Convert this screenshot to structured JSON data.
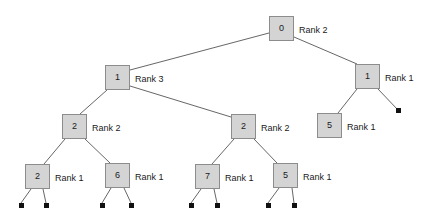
{
  "diagram": {
    "background_color": "#ffffff",
    "node_fill_color": "#d4d4d4",
    "node_border_color": "#8c8c8c",
    "edge_color": "#555555",
    "leaf_color": "#111111",
    "text_color": "#1a1a1a"
  },
  "nodes": [
    {
      "id": "n0",
      "key": "0",
      "rank": "Rank 2",
      "x": 269,
      "y": 16,
      "w": 25,
      "h": 25,
      "label_x": 299,
      "label_y": 26
    },
    {
      "id": "n1",
      "key": "1",
      "rank": "Rank 3",
      "x": 105,
      "y": 65,
      "w": 25,
      "h": 25,
      "label_x": 135,
      "label_y": 75
    },
    {
      "id": "n2",
      "key": "1",
      "rank": "Rank 1",
      "x": 355,
      "y": 64,
      "w": 25,
      "h": 25,
      "label_x": 385,
      "label_y": 74
    },
    {
      "id": "n3",
      "key": "2",
      "rank": "Rank 2",
      "x": 62,
      "y": 114,
      "w": 25,
      "h": 25,
      "label_x": 92,
      "label_y": 124
    },
    {
      "id": "n4",
      "key": "2",
      "rank": "Rank 2",
      "x": 231,
      "y": 114,
      "w": 25,
      "h": 25,
      "label_x": 261,
      "label_y": 124
    },
    {
      "id": "n5",
      "key": "5",
      "rank": "Rank 1",
      "x": 317,
      "y": 113,
      "w": 25,
      "h": 25,
      "label_x": 347,
      "label_y": 123
    },
    {
      "id": "n6",
      "key": "2",
      "rank": "Rank 1",
      "x": 25,
      "y": 164,
      "w": 25,
      "h": 25,
      "label_x": 55,
      "label_y": 174
    },
    {
      "id": "n7",
      "key": "6",
      "rank": "Rank 1",
      "x": 105,
      "y": 163,
      "w": 25,
      "h": 25,
      "label_x": 135,
      "label_y": 173
    },
    {
      "id": "n8",
      "key": "7",
      "rank": "Rank 1",
      "x": 195,
      "y": 164,
      "w": 25,
      "h": 25,
      "label_x": 225,
      "label_y": 174
    },
    {
      "id": "n9",
      "key": "5",
      "rank": "Rank 1",
      "x": 273,
      "y": 163,
      "w": 25,
      "h": 25,
      "label_x": 303,
      "label_y": 173
    }
  ],
  "leaves": [
    {
      "id": "L1",
      "x": 19,
      "y": 203,
      "size": 5
    },
    {
      "id": "L2",
      "x": 44,
      "y": 203,
      "size": 5
    },
    {
      "id": "L3",
      "x": 100,
      "y": 203,
      "size": 5
    },
    {
      "id": "L4",
      "x": 129,
      "y": 203,
      "size": 5
    },
    {
      "id": "L5",
      "x": 189,
      "y": 203,
      "size": 5
    },
    {
      "id": "L6",
      "x": 215,
      "y": 203,
      "size": 5
    },
    {
      "id": "L7",
      "x": 266,
      "y": 203,
      "size": 5
    },
    {
      "id": "L8",
      "x": 292,
      "y": 203,
      "size": 5
    },
    {
      "id": "L9",
      "x": 396,
      "y": 108,
      "size": 5
    }
  ],
  "edges": [
    {
      "from": "n0",
      "to": "n1",
      "x1": 269,
      "y1": 33,
      "x2": 130,
      "y2": 70
    },
    {
      "from": "n0",
      "to": "n2",
      "x1": 294,
      "y1": 37,
      "x2": 357,
      "y2": 64
    },
    {
      "from": "n1",
      "to": "n3",
      "x1": 107,
      "y1": 90,
      "x2": 80,
      "y2": 114
    },
    {
      "from": "n1",
      "to": "n4",
      "x1": 130,
      "y1": 86,
      "x2": 231,
      "y2": 117
    },
    {
      "from": "n2",
      "to": "n5",
      "x1": 357,
      "y1": 89,
      "x2": 338,
      "y2": 113
    },
    {
      "from": "n2",
      "to": "L9",
      "x1": 378,
      "y1": 89,
      "x2": 398,
      "y2": 110
    },
    {
      "from": "n3",
      "to": "n6",
      "x1": 65,
      "y1": 139,
      "x2": 44,
      "y2": 164
    },
    {
      "from": "n3",
      "to": "n7",
      "x1": 85,
      "y1": 139,
      "x2": 110,
      "y2": 163
    },
    {
      "from": "n4",
      "to": "n8",
      "x1": 234,
      "y1": 139,
      "x2": 212,
      "y2": 164
    },
    {
      "from": "n4",
      "to": "n9",
      "x1": 254,
      "y1": 139,
      "x2": 277,
      "y2": 163
    },
    {
      "from": "n6",
      "to": "L1",
      "x1": 31,
      "y1": 189,
      "x2": 21,
      "y2": 203
    },
    {
      "from": "n6",
      "to": "L2",
      "x1": 43,
      "y1": 189,
      "x2": 46,
      "y2": 203
    },
    {
      "from": "n7",
      "to": "L3",
      "x1": 111,
      "y1": 188,
      "x2": 102,
      "y2": 203
    },
    {
      "from": "n7",
      "to": "L4",
      "x1": 124,
      "y1": 188,
      "x2": 131,
      "y2": 203
    },
    {
      "from": "n8",
      "to": "L5",
      "x1": 201,
      "y1": 189,
      "x2": 191,
      "y2": 203
    },
    {
      "from": "n8",
      "to": "L6",
      "x1": 214,
      "y1": 189,
      "x2": 217,
      "y2": 203
    },
    {
      "from": "n9",
      "to": "L7",
      "x1": 279,
      "y1": 188,
      "x2": 268,
      "y2": 203
    },
    {
      "from": "n9",
      "to": "L8",
      "x1": 292,
      "y1": 188,
      "x2": 294,
      "y2": 203
    }
  ]
}
